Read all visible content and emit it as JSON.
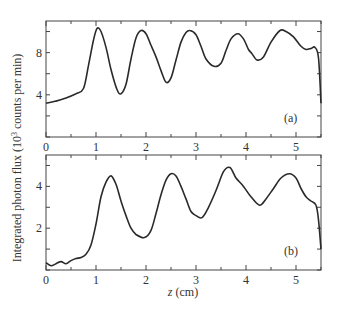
{
  "figure": {
    "ylabel_prefix": "Integrated photon flux (10",
    "ylabel_sup": "3",
    "ylabel_suffix": " counts per min)",
    "xlabel_italic": "z",
    "xlabel_units": " (cm)"
  },
  "chart_data": [
    {
      "type": "line",
      "panel_label": "(a)",
      "title": "",
      "xlabel": "z (cm)",
      "ylabel": "Integrated photon flux (10^3 counts per min)",
      "xlim": [
        0,
        5.5
      ],
      "ylim": [
        0,
        11
      ],
      "xticks": [
        0,
        1,
        2,
        3,
        4,
        5
      ],
      "xtick_labels": [
        "0",
        "1",
        "2",
        "3",
        "4",
        "5"
      ],
      "yticks": [
        0,
        2,
        4,
        6,
        8,
        10
      ],
      "ytick_labels": [
        "",
        "",
        "4",
        "",
        "8",
        ""
      ],
      "grid": false,
      "series": [
        {
          "name": "panel a",
          "x": [
            0,
            0.2,
            0.4,
            0.6,
            0.75,
            0.85,
            0.95,
            1.02,
            1.1,
            1.2,
            1.3,
            1.42,
            1.5,
            1.6,
            1.7,
            1.8,
            1.9,
            2.0,
            2.1,
            2.2,
            2.3,
            2.4,
            2.5,
            2.6,
            2.7,
            2.8,
            2.88,
            3.0,
            3.1,
            3.2,
            3.36,
            3.5,
            3.6,
            3.7,
            3.84,
            3.95,
            4.05,
            4.12,
            4.22,
            4.35,
            4.5,
            4.68,
            4.8,
            4.95,
            5.1,
            5.2,
            5.3,
            5.38,
            5.45,
            5.5
          ],
          "y": [
            3.2,
            3.4,
            3.7,
            4.1,
            4.6,
            6.8,
            9.2,
            10.3,
            10.0,
            8.5,
            6.4,
            4.5,
            4.1,
            5.0,
            7.4,
            9.4,
            10.1,
            9.8,
            8.7,
            7.6,
            6.3,
            5.2,
            5.6,
            7.3,
            9.0,
            9.9,
            10.1,
            9.7,
            8.6,
            7.4,
            6.7,
            7.0,
            8.2,
            9.3,
            9.8,
            9.3,
            8.3,
            7.9,
            7.3,
            7.6,
            9.0,
            10.1,
            10.0,
            9.5,
            8.6,
            8.3,
            8.4,
            8.5,
            7.5,
            3.2
          ]
        }
      ]
    },
    {
      "type": "line",
      "panel_label": "(b)",
      "title": "",
      "xlabel": "z (cm)",
      "ylabel": "Integrated photon flux (10^3 counts per min)",
      "xlim": [
        0,
        5.5
      ],
      "ylim": [
        0,
        5.5
      ],
      "xticks": [
        0,
        1,
        2,
        3,
        4,
        5
      ],
      "xtick_labels": [
        "0",
        "1",
        "2",
        "3",
        "4",
        "5"
      ],
      "yticks": [
        0,
        1,
        2,
        3,
        4,
        5
      ],
      "ytick_labels": [
        "",
        "",
        "2",
        "",
        "4",
        ""
      ],
      "grid": false,
      "series": [
        {
          "name": "panel b",
          "x": [
            0,
            0.1,
            0.2,
            0.3,
            0.4,
            0.5,
            0.6,
            0.7,
            0.8,
            0.9,
            1.0,
            1.1,
            1.2,
            1.3,
            1.4,
            1.5,
            1.6,
            1.7,
            1.8,
            1.97,
            2.1,
            2.2,
            2.3,
            2.4,
            2.5,
            2.6,
            2.7,
            2.8,
            2.9,
            3.0,
            3.12,
            3.25,
            3.4,
            3.55,
            3.68,
            3.8,
            3.95,
            4.1,
            4.27,
            4.4,
            4.55,
            4.7,
            4.87,
            5.0,
            5.1,
            5.2,
            5.3,
            5.4,
            5.45,
            5.5
          ],
          "y": [
            0.35,
            0.2,
            0.3,
            0.4,
            0.3,
            0.45,
            0.55,
            0.6,
            0.75,
            1.2,
            2.2,
            3.5,
            4.2,
            4.5,
            4.1,
            3.3,
            2.6,
            2.0,
            1.7,
            1.55,
            1.9,
            2.7,
            3.6,
            4.3,
            4.6,
            4.5,
            4.0,
            3.4,
            2.8,
            2.6,
            2.5,
            3.0,
            3.8,
            4.7,
            4.9,
            4.4,
            4.0,
            3.5,
            3.1,
            3.4,
            3.9,
            4.4,
            4.6,
            4.4,
            3.9,
            3.5,
            3.3,
            3.1,
            2.4,
            1.0
          ]
        }
      ]
    }
  ]
}
